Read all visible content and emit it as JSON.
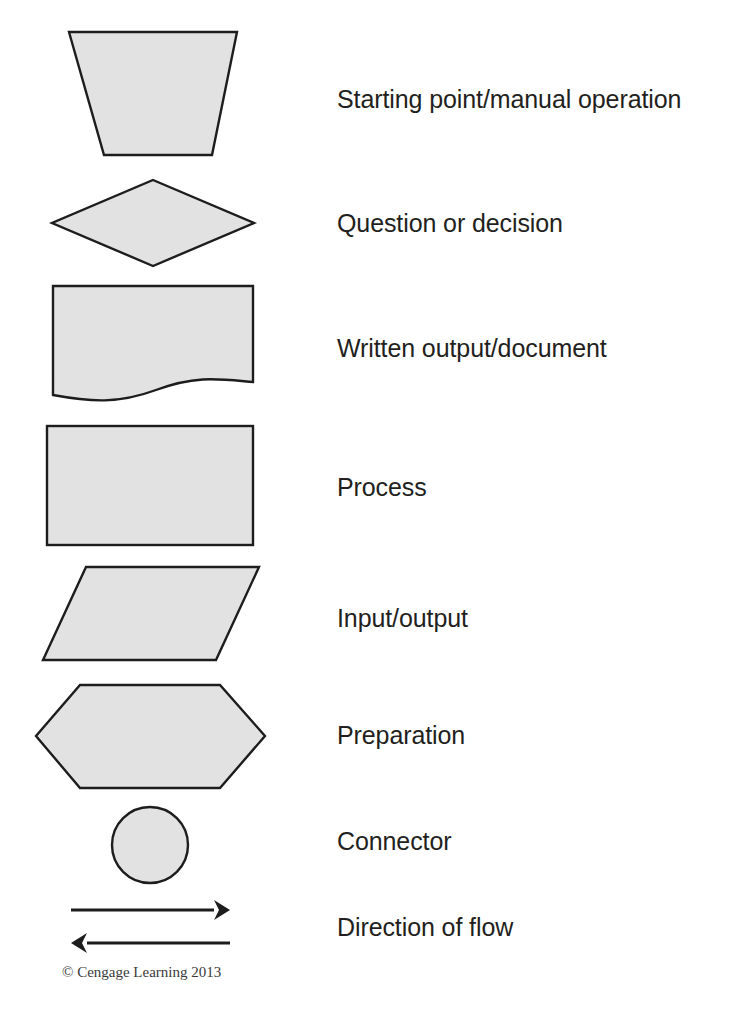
{
  "page": {
    "background_color": "#ffffff",
    "width": 751,
    "height": 1035
  },
  "style": {
    "shape_fill": "#e2e2e2",
    "shape_stroke": "#1d1d1d",
    "label_color": "#231f20",
    "arrow_color": "#1d1d1d",
    "copyright_color": "#3a3a3a"
  },
  "legend": {
    "rows": [
      {
        "id": "start",
        "symbol": "inverted-trapezoid-shape",
        "label": "Starting point/manual operation"
      },
      {
        "id": "decision",
        "symbol": "diamond-shape",
        "label": "Question or decision"
      },
      {
        "id": "document",
        "symbol": "document-wavy-bottom-shape",
        "label": "Written output/document"
      },
      {
        "id": "process",
        "symbol": "rectangle-shape",
        "label": "Process"
      },
      {
        "id": "inputoutput",
        "symbol": "parallelogram-shape",
        "label": "Input/output"
      },
      {
        "id": "preparation",
        "symbol": "hexagon-shape",
        "label": "Preparation"
      },
      {
        "id": "connector",
        "symbol": "circle-shape",
        "label": "Connector"
      },
      {
        "id": "flow",
        "symbol": "double-arrow-shape",
        "label": "Direction of flow"
      }
    ]
  },
  "footer": {
    "copyright": "© Cengage Learning 2013"
  }
}
